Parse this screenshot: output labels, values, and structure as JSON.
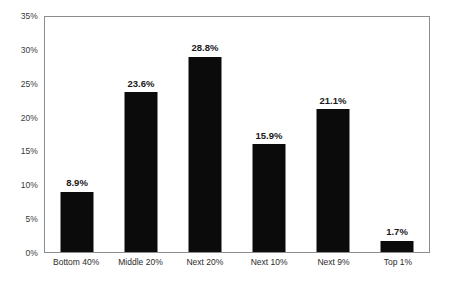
{
  "chart_data": {
    "type": "bar",
    "title": "",
    "subtitle": "",
    "xlabel": "",
    "ylabel": "",
    "categories": [
      "Bottom 40%",
      "Middle 20%",
      "Next 20%",
      "Next 10%",
      "Next 9%",
      "Top 1%"
    ],
    "values": [
      8.9,
      23.6,
      28.8,
      15.9,
      21.1,
      1.7
    ],
    "value_labels": [
      "8.9%",
      "23.6%",
      "28.8%",
      "15.9%",
      "21.1%",
      "1.7%"
    ],
    "ylim": [
      0,
      35
    ],
    "ytick_values": [
      0,
      5,
      10,
      15,
      20,
      25,
      30,
      35
    ],
    "ytick_labels": [
      "0%",
      "5%",
      "10%",
      "15%",
      "20%",
      "25%",
      "30%",
      "35%"
    ],
    "grid": false,
    "legend": null,
    "series": [
      {
        "name": "",
        "values": [
          8.9,
          23.6,
          28.8,
          15.9,
          21.1,
          1.7
        ],
        "color": "#0b0b0b"
      }
    ],
    "colors": {
      "bar": "#0b0b0b",
      "frame": "#8c8c8c",
      "tick_text": "#3a3a3a",
      "category_text": "#2b2b2b",
      "value_text": "#1a1a1a",
      "background": "#ffffff"
    }
  }
}
